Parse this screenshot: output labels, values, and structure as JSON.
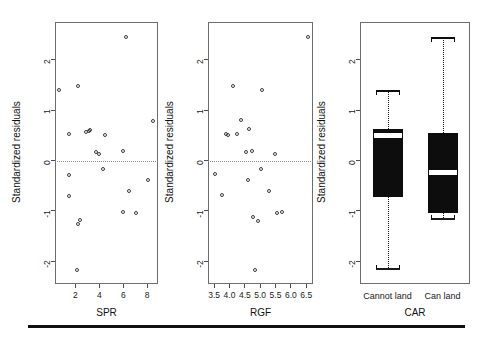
{
  "figure": {
    "background_color": "#ffffff",
    "point_color": "#3a3a3a",
    "box_fill_color": "#0d0d0d",
    "median_color": "#ffffff",
    "frame_color": "#6e6e6e",
    "zero_line_style": "dotted",
    "bottom_rule": true
  },
  "chart_data": [
    {
      "type": "scatter",
      "title": "",
      "xlabel": "SPR",
      "ylabel": "Standardized residuals",
      "xlim": [
        0.3,
        8.9
      ],
      "ylim": [
        -2.45,
        2.75
      ],
      "xticks": [
        2,
        4,
        6,
        8
      ],
      "yticks": [
        -2,
        -1,
        0,
        1,
        2
      ],
      "xticklabels": [
        "2",
        "4",
        "6",
        "8"
      ],
      "yticklabels": [
        "-2",
        "-1",
        "0",
        "1",
        "2"
      ],
      "grid": false,
      "reference_line_y": 0,
      "legend": "none",
      "points": [
        {
          "x": 6.2,
          "y": 2.45
        },
        {
          "x": 0.6,
          "y": 1.4
        },
        {
          "x": 2.2,
          "y": 1.48
        },
        {
          "x": 8.5,
          "y": 0.78
        },
        {
          "x": 1.5,
          "y": 0.52
        },
        {
          "x": 2.9,
          "y": 0.56
        },
        {
          "x": 3.1,
          "y": 0.58
        },
        {
          "x": 3.25,
          "y": 0.6
        },
        {
          "x": 4.5,
          "y": 0.5
        },
        {
          "x": 3.75,
          "y": 0.17
        },
        {
          "x": 3.95,
          "y": 0.13
        },
        {
          "x": 6.0,
          "y": 0.18
        },
        {
          "x": 4.3,
          "y": -0.17
        },
        {
          "x": 1.45,
          "y": -0.28
        },
        {
          "x": 8.1,
          "y": -0.39
        },
        {
          "x": 6.45,
          "y": -0.61
        },
        {
          "x": 1.5,
          "y": -0.7
        },
        {
          "x": 5.95,
          "y": -1.03
        },
        {
          "x": 7.05,
          "y": -1.05
        },
        {
          "x": 2.2,
          "y": -1.25
        },
        {
          "x": 2.4,
          "y": -1.18
        },
        {
          "x": 2.1,
          "y": -2.18
        }
      ]
    },
    {
      "type": "scatter",
      "title": "",
      "xlabel": "RGF",
      "ylabel": "Standardized residuals",
      "xlim": [
        3.3,
        6.72
      ],
      "ylim": [
        -2.45,
        2.75
      ],
      "xticks": [
        3.5,
        4.0,
        4.5,
        5.0,
        5.5,
        6.0,
        6.5
      ],
      "yticks": [
        -2,
        -1,
        0,
        1,
        2
      ],
      "xticklabels": [
        "3.5",
        "4.0",
        "4.5",
        "5.0",
        "5.5",
        "6.0",
        "6.5"
      ],
      "yticklabels": [
        "-2",
        "-1",
        "0",
        "1",
        "2"
      ],
      "grid": false,
      "reference_line_y": 0,
      "legend": "none",
      "points": [
        {
          "x": 6.55,
          "y": 2.45
        },
        {
          "x": 4.13,
          "y": 1.47
        },
        {
          "x": 5.05,
          "y": 1.4
        },
        {
          "x": 4.38,
          "y": 0.8
        },
        {
          "x": 4.62,
          "y": 0.62
        },
        {
          "x": 3.88,
          "y": 0.52
        },
        {
          "x": 3.95,
          "y": 0.5
        },
        {
          "x": 4.25,
          "y": 0.53
        },
        {
          "x": 4.55,
          "y": 0.17
        },
        {
          "x": 4.72,
          "y": 0.18
        },
        {
          "x": 5.48,
          "y": 0.13
        },
        {
          "x": 3.52,
          "y": -0.27
        },
        {
          "x": 5.02,
          "y": -0.17
        },
        {
          "x": 4.6,
          "y": -0.38
        },
        {
          "x": 5.3,
          "y": -0.6
        },
        {
          "x": 3.75,
          "y": -0.69
        },
        {
          "x": 5.55,
          "y": -1.04
        },
        {
          "x": 5.72,
          "y": -1.03
        },
        {
          "x": 4.78,
          "y": -1.13
        },
        {
          "x": 4.92,
          "y": -1.2
        },
        {
          "x": 4.82,
          "y": -2.18
        }
      ]
    },
    {
      "type": "boxplot",
      "title": "",
      "xlabel": "CAR",
      "ylabel": "Standardized residuals",
      "ylim": [
        -2.45,
        2.75
      ],
      "yticks": [
        -2,
        -1,
        0,
        1,
        2
      ],
      "yticklabels": [
        "-2",
        "-1",
        "0",
        "1",
        "2"
      ],
      "categories": [
        "Cannot land",
        "Can land"
      ],
      "grid": false,
      "legend": "none",
      "boxes": [
        {
          "label": "Cannot land",
          "whisker_low": -2.18,
          "q1": -0.72,
          "median": 0.5,
          "q3": 0.63,
          "whisker_high": 1.4
        },
        {
          "label": "Can land",
          "whisker_low": -1.18,
          "q1": -1.05,
          "median": -0.22,
          "q3": 0.55,
          "whisker_high": 2.45
        }
      ]
    }
  ]
}
